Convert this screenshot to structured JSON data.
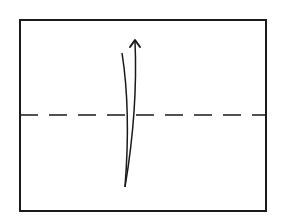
{
  "diagram": {
    "type": "origami-fold-step",
    "background": "#ffffff",
    "stroke_color": "#1a1a1a",
    "paper": {
      "x": 20,
      "y": 20,
      "width": 246,
      "height": 191,
      "stroke_width": 2
    },
    "fold_line": {
      "style": "valley-dashed",
      "y": 115,
      "x1": 20,
      "x2": 266,
      "dash": [
        18,
        11
      ],
      "stroke_width": 1.5
    },
    "fold_arrow": {
      "direction": "up",
      "tail_path": "M 122 53 Q 131 110 125 187",
      "head_path": "M 125 187 Q 138 110 135 41",
      "arrow_tip": {
        "x": 135,
        "y": 40
      },
      "stroke_width": 1.5
    }
  }
}
